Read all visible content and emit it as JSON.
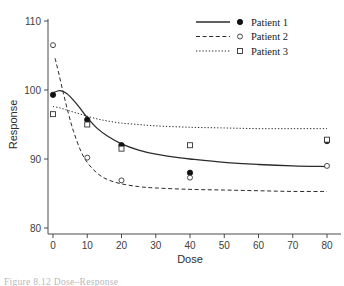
{
  "chart_data": {
    "type": "line",
    "title": "",
    "xlabel": "Dose",
    "ylabel": "Response",
    "xlim": [
      0,
      80
    ],
    "ylim": [
      80,
      110
    ],
    "xticks": [
      0,
      10,
      20,
      30,
      40,
      50,
      60,
      70,
      80
    ],
    "yticks": [
      80,
      90,
      100,
      110
    ],
    "grid": false,
    "legend_position": "top-right",
    "x": [
      0,
      10,
      20,
      40,
      80
    ],
    "series": [
      {
        "name": "Patient 1",
        "values": [
          99.3,
          95.7,
          92.0,
          88.0,
          92.6
        ],
        "linestyle": "solid",
        "marker": "filled-circle",
        "color": "#111111",
        "fit_curve": [
          [
            0,
            99.6
          ],
          [
            2,
            99.9
          ],
          [
            4,
            99.5
          ],
          [
            6,
            98.5
          ],
          [
            8,
            97.3
          ],
          [
            10,
            96.0
          ],
          [
            13,
            94.4
          ],
          [
            16,
            93.3
          ],
          [
            20,
            92.2
          ],
          [
            25,
            91.3
          ],
          [
            30,
            90.7
          ],
          [
            35,
            90.3
          ],
          [
            40,
            90.0
          ],
          [
            50,
            89.5
          ],
          [
            60,
            89.2
          ],
          [
            70,
            89.0
          ],
          [
            80,
            88.9
          ]
        ]
      },
      {
        "name": "Patient 2",
        "values": [
          106.5,
          90.2,
          null,
          87.3,
          89.0
        ],
        "linestyle": "dashed",
        "marker": "open-circle",
        "color": "#333333",
        "fit_curve": [
          [
            0.6,
            104.6
          ],
          [
            1.5,
            102.8
          ],
          [
            3,
            99.6
          ],
          [
            4.5,
            96.6
          ],
          [
            6,
            94.0
          ],
          [
            8,
            91.3
          ],
          [
            10,
            89.5
          ],
          [
            13,
            87.9
          ],
          [
            16,
            87.0
          ],
          [
            20,
            86.4
          ],
          [
            25,
            86.0
          ],
          [
            30,
            85.8
          ],
          [
            40,
            85.6
          ],
          [
            50,
            85.5
          ],
          [
            60,
            85.4
          ],
          [
            70,
            85.3
          ],
          [
            80,
            85.3
          ]
        ]
      },
      {
        "name": "Patient 3",
        "values": [
          96.5,
          95.0,
          91.5,
          92.0,
          92.8
        ],
        "linestyle": "dotted",
        "marker": "open-square",
        "color": "#333333",
        "fit_curve": [
          [
            0,
            97.6
          ],
          [
            2,
            97.4
          ],
          [
            4,
            97.1
          ],
          [
            6,
            96.8
          ],
          [
            8,
            96.5
          ],
          [
            10,
            96.2
          ],
          [
            13,
            95.8
          ],
          [
            16,
            95.5
          ],
          [
            20,
            95.2
          ],
          [
            25,
            95.0
          ],
          [
            30,
            94.8
          ],
          [
            40,
            94.6
          ],
          [
            50,
            94.5
          ],
          [
            60,
            94.4
          ],
          [
            70,
            94.4
          ],
          [
            80,
            94.4
          ]
        ]
      }
    ],
    "extra_points": [
      {
        "series": "Patient 2",
        "x": 20,
        "y": 86.9
      }
    ]
  },
  "legend": {
    "entries": [
      {
        "label": "Patient 1"
      },
      {
        "label": "Patient 2"
      },
      {
        "label": "Patient 3"
      }
    ]
  },
  "caption": {
    "text": "Figure 8.12  Dose–Response"
  }
}
